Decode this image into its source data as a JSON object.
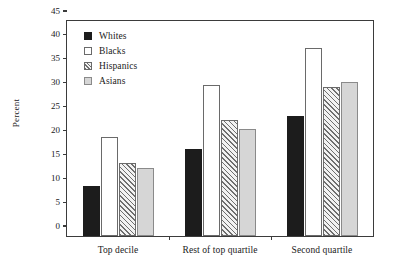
{
  "chart_data": {
    "type": "bar",
    "title": "",
    "subtitle": "",
    "xlabel": "",
    "ylabel": "Percent",
    "categories": [
      "Top decile",
      "Rest of top quartile",
      "Second quartile"
    ],
    "series": [
      {
        "name": "Whites",
        "values": [
          10.5,
          18.2,
          25.2
        ]
      },
      {
        "name": "Blacks",
        "values": [
          20.8,
          31.6,
          39.4
        ]
      },
      {
        "name": "Hispanics",
        "values": [
          15.2,
          24.2,
          31.1
        ]
      },
      {
        "name": "Asians",
        "values": [
          14.2,
          22.5,
          32.2
        ]
      }
    ],
    "ylim": [
      0,
      45
    ],
    "yticks": [
      0,
      5,
      10,
      15,
      20,
      25,
      30,
      35,
      40,
      45
    ],
    "ytick_labels": [
      "0",
      "5",
      "10",
      "15",
      "20",
      "25",
      "30",
      "35",
      "40",
      "45"
    ],
    "grid": false,
    "legend_position": "top-left",
    "legend": [
      {
        "label": "Whites",
        "swatch": "solid-black"
      },
      {
        "label": "Blacks",
        "swatch": "white-outline"
      },
      {
        "label": "Hispanics",
        "swatch": "diagonal-hatch"
      },
      {
        "label": "Asians",
        "swatch": "light-gray"
      }
    ],
    "colors": {
      "whites": "#1c1c1c",
      "blacks": "#ffffff",
      "hispanics": "#f2f2f2",
      "asians": "#d6d6d6",
      "axis": "#3b3b3b",
      "background": "#ffffff"
    }
  }
}
